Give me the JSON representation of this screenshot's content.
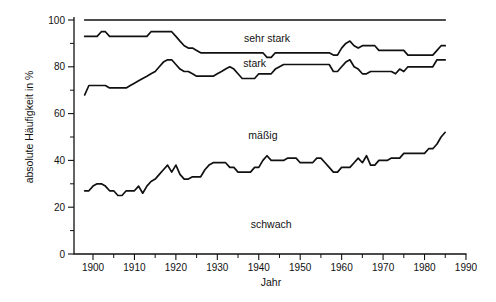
{
  "figure": {
    "background": "#ffffff",
    "line_color": "#111111"
  },
  "axes": {
    "x_label": "Jahr",
    "y_label": "absolute Häufigkeit in %",
    "x_major_ticks": [
      1900,
      1910,
      1920,
      1930,
      1940,
      1950,
      1960,
      1970,
      1980,
      1990
    ],
    "x_minor_ticks": [
      1905,
      1915,
      1925,
      1935,
      1945,
      1955,
      1965,
      1975,
      1985
    ],
    "y_major_ticks": [
      0,
      20,
      40,
      60,
      80,
      100
    ],
    "y_minor_ticks": [
      10,
      30,
      50,
      70,
      90
    ],
    "y_range": [
      0,
      100
    ],
    "x_range": [
      1898,
      1990
    ]
  },
  "region_labels": [
    {
      "text": "sehr stark",
      "year": 1942,
      "value": 92.5
    },
    {
      "text": "stark",
      "year": 1939,
      "value": 81.5
    },
    {
      "text": "mäßig",
      "year": 1941,
      "value": 51
    },
    {
      "text": "schwach",
      "year": 1943,
      "value": 13
    }
  ],
  "chart_data": {
    "type": "line",
    "title": "",
    "xlabel": "Jahr",
    "ylabel": "absolute Häufigkeit in %",
    "xlim": [
      1895,
      1990
    ],
    "ylim": [
      0,
      100
    ],
    "grid": false,
    "legend_position": "inline-region-labels",
    "years": [
      1898,
      1899,
      1900,
      1901,
      1902,
      1903,
      1904,
      1905,
      1906,
      1907,
      1908,
      1909,
      1910,
      1911,
      1912,
      1913,
      1914,
      1915,
      1916,
      1917,
      1918,
      1919,
      1920,
      1921,
      1922,
      1923,
      1924,
      1925,
      1926,
      1927,
      1928,
      1929,
      1930,
      1931,
      1932,
      1933,
      1934,
      1935,
      1936,
      1937,
      1938,
      1939,
      1940,
      1941,
      1942,
      1943,
      1944,
      1945,
      1946,
      1947,
      1948,
      1949,
      1950,
      1951,
      1952,
      1953,
      1954,
      1955,
      1956,
      1957,
      1958,
      1959,
      1960,
      1961,
      1962,
      1963,
      1964,
      1965,
      1966,
      1967,
      1968,
      1969,
      1970,
      1971,
      1972,
      1973,
      1974,
      1975,
      1976,
      1977,
      1978,
      1979,
      1980,
      1981,
      1982,
      1983,
      1984,
      1985
    ],
    "series": [
      {
        "name": "total (top boundary, 100 %)",
        "region_above": null,
        "values": [
          100,
          100,
          100,
          100,
          100,
          100,
          100,
          100,
          100,
          100,
          100,
          100,
          100,
          100,
          100,
          100,
          100,
          100,
          100,
          100,
          100,
          100,
          100,
          100,
          100,
          100,
          100,
          100,
          100,
          100,
          100,
          100,
          100,
          100,
          100,
          100,
          100,
          100,
          100,
          100,
          100,
          100,
          100,
          100,
          100,
          100,
          100,
          100,
          100,
          100,
          100,
          100,
          100,
          100,
          100,
          100,
          100,
          100,
          100,
          100,
          100,
          100,
          100,
          100,
          100,
          100,
          100,
          100,
          100,
          100,
          100,
          100,
          100,
          100,
          100,
          100,
          100,
          100,
          100,
          100,
          100,
          100,
          100,
          100,
          100,
          100,
          100,
          100
        ]
      },
      {
        "name": "cumulative up to stark (lower boundary of sehr stark)",
        "region_above": "sehr stark",
        "values": [
          93,
          93,
          93,
          93,
          95,
          95,
          93,
          93,
          93,
          93,
          93,
          93,
          93,
          93,
          93,
          93,
          95,
          95,
          95,
          95,
          95,
          95,
          93,
          91,
          89,
          88,
          88,
          87,
          86,
          86,
          86,
          86,
          86,
          86,
          86,
          86,
          86,
          86,
          86,
          86,
          86,
          86,
          86,
          86,
          84,
          84,
          86,
          86,
          86,
          86,
          86,
          86,
          86,
          86,
          86,
          86,
          86,
          86,
          86,
          86,
          85,
          85,
          88,
          90,
          91,
          89,
          88,
          89,
          89,
          89,
          89,
          87,
          87,
          87,
          87,
          87,
          87,
          87,
          85,
          85,
          85,
          85,
          85,
          85,
          85,
          87,
          89,
          89
        ]
      },
      {
        "name": "cumulative up to mäßig (lower boundary of stark)",
        "region_above": "stark",
        "values": [
          68,
          72,
          72,
          72,
          72,
          72,
          71,
          71,
          71,
          71,
          71,
          72,
          73,
          74,
          75,
          76,
          77,
          78,
          80,
          82,
          83,
          83,
          81,
          79,
          78,
          78,
          77,
          76,
          76,
          76,
          76,
          76,
          77,
          78,
          79,
          80,
          79,
          77,
          75,
          75,
          75,
          75,
          77,
          77,
          77,
          77,
          79,
          80,
          81,
          81,
          81,
          81,
          81,
          81,
          81,
          81,
          81,
          81,
          81,
          81,
          78,
          78,
          80,
          82,
          83,
          80,
          79,
          77,
          77,
          78,
          78,
          78,
          78,
          78,
          78,
          77,
          79,
          78,
          80,
          80,
          80,
          80,
          80,
          80,
          80,
          83,
          83,
          83
        ]
      },
      {
        "name": "cumulative schwach (lower boundary of mäßig)",
        "region_above": "mäßig",
        "region_below": "schwach",
        "values": [
          27,
          27,
          29,
          30,
          30,
          29,
          27,
          27,
          25,
          25,
          27,
          27,
          27,
          29,
          26,
          29,
          31,
          32,
          34,
          36,
          38,
          35,
          38,
          34,
          32,
          32,
          33,
          33,
          33,
          36,
          38,
          39,
          39,
          39,
          39,
          37,
          37,
          35,
          35,
          35,
          35,
          37,
          37,
          40,
          42,
          40,
          40,
          40,
          40,
          41,
          41,
          41,
          39,
          39,
          39,
          39,
          41,
          41,
          39,
          37,
          35,
          35,
          37,
          37,
          37,
          39,
          41,
          39,
          42,
          38,
          38,
          40,
          40,
          40,
          41,
          41,
          41,
          43,
          43,
          43,
          43,
          43,
          43,
          45,
          45,
          47,
          50,
          52
        ]
      }
    ]
  }
}
